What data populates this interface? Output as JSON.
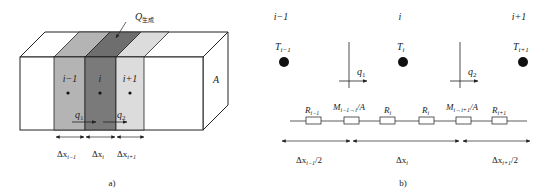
{
  "figure_a": {
    "caption": "a)",
    "heat_label": "Q",
    "heat_subscript": "生成",
    "area_label": "A",
    "cells": [
      {
        "label": "i−1",
        "color": "#b4b4b4"
      },
      {
        "label": "i",
        "color": "#7a7a7a"
      },
      {
        "label": "i+1",
        "color": "#dcdcdc"
      }
    ],
    "flux": [
      {
        "label": "q",
        "sub": "1"
      },
      {
        "label": "q",
        "sub": "2"
      }
    ],
    "widths": [
      {
        "label": "Δx",
        "sub": "i−1"
      },
      {
        "label": "Δx",
        "sub": "i"
      },
      {
        "label": "Δx",
        "sub": "i+1"
      }
    ]
  },
  "figure_b": {
    "caption": "b)",
    "nodes": [
      {
        "index": "i−1",
        "temp": "T",
        "temp_sub": "i−1"
      },
      {
        "index": "i",
        "temp": "T",
        "temp_sub": "i"
      },
      {
        "index": "i+1",
        "temp": "T",
        "temp_sub": "i+1"
      }
    ],
    "flux": [
      {
        "label": "q",
        "sub": "1"
      },
      {
        "label": "q",
        "sub": "2"
      }
    ],
    "resistors": [
      {
        "label": "R",
        "sub": "i−1",
        "suffix": ""
      },
      {
        "label": "M",
        "sub": "i−1→i",
        "suffix": "/A"
      },
      {
        "label": "R",
        "sub": "i",
        "suffix": ""
      },
      {
        "label": "R",
        "sub": "i",
        "suffix": ""
      },
      {
        "label": "M",
        "sub": "i→i+1",
        "suffix": "/A"
      },
      {
        "label": "R",
        "sub": "i+1",
        "suffix": ""
      }
    ],
    "spans": [
      {
        "label": "Δx",
        "sub": "i−1",
        "suffix": "/2"
      },
      {
        "label": "Δx",
        "sub": "i",
        "suffix": ""
      },
      {
        "label": "Δx",
        "sub": "i+1",
        "suffix": "/2"
      }
    ]
  }
}
